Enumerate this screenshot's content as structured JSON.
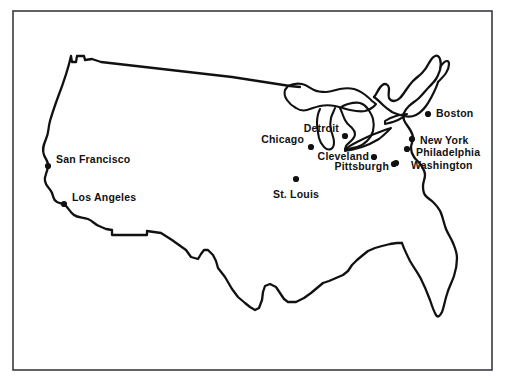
{
  "figure": {
    "width": 506,
    "height": 387,
    "background_color": "#ffffff",
    "outline_color": "#111111",
    "frame_color": "#3a3a42"
  },
  "frame": {
    "x": 13,
    "y": 11,
    "width": 479,
    "height": 359,
    "stroke_width": 1.6
  },
  "cities": [
    {
      "name": "San Francisco",
      "label": "San Francisco",
      "dot_x": 48,
      "dot_y": 166,
      "label_x": 56,
      "label_y": 159,
      "align": "right"
    },
    {
      "name": "Los Angeles",
      "label": "Los Angeles",
      "dot_x": 64,
      "dot_y": 204,
      "label_x": 72,
      "label_y": 197,
      "align": "right"
    },
    {
      "name": "St. Louis",
      "label": "St. Louis",
      "dot_x": 296,
      "dot_y": 179,
      "label_x": 296,
      "label_y": 189,
      "align": "left-center"
    },
    {
      "name": "Chicago",
      "label": "Chicago",
      "dot_x": 311,
      "dot_y": 147,
      "label_x": 304,
      "label_y": 139,
      "align": "left"
    },
    {
      "name": "Detroit",
      "label": "Detroit",
      "dot_x": 345,
      "dot_y": 136,
      "label_x": 339,
      "label_y": 128,
      "align": "left"
    },
    {
      "name": "Cleveland",
      "label": "Cleveland",
      "dot_x": 374,
      "dot_y": 157,
      "label_x": 369,
      "label_y": 156,
      "align": "left"
    },
    {
      "name": "Pittsburgh",
      "label": "Pittsburgh",
      "dot_x": 394,
      "dot_y": 164,
      "label_x": 389,
      "label_y": 166,
      "align": "left"
    },
    {
      "name": "Boston",
      "label": "Boston",
      "dot_x": 428,
      "dot_y": 114,
      "label_x": 436,
      "label_y": 113,
      "align": "right"
    },
    {
      "name": "New York",
      "label": "New York",
      "dot_x": 412,
      "dot_y": 139,
      "label_x": 420,
      "label_y": 140,
      "align": "right"
    },
    {
      "name": "Philadelphia",
      "label": "Philadelphia",
      "dot_x": 407,
      "dot_y": 149,
      "label_x": 416,
      "label_y": 152,
      "align": "right"
    },
    {
      "name": "Washington",
      "label": "Washington",
      "dot_x": 396,
      "dot_y": 163,
      "label_x": 411,
      "label_y": 165,
      "align": "right"
    }
  ],
  "dot_radius": 3.1
}
